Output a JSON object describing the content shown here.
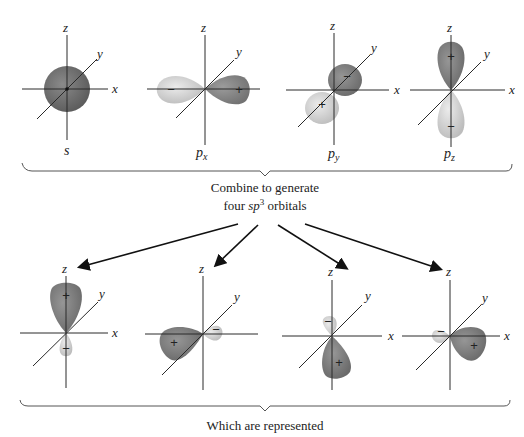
{
  "colors": {
    "dark_lobe": "#6e6e6e",
    "light_lobe": "#d4d4d4",
    "axis": "#2a2a2a",
    "background": "#ffffff"
  },
  "axis_labels": {
    "x": "x",
    "y": "y",
    "z": "z"
  },
  "atomic_orbitals": [
    {
      "id": "s",
      "label": "s",
      "subscript": "",
      "signs": []
    },
    {
      "id": "px",
      "label": "p",
      "subscript": "x",
      "signs": [
        "−",
        "+"
      ]
    },
    {
      "id": "py",
      "label": "p",
      "subscript": "y",
      "signs": [
        "−",
        "+"
      ]
    },
    {
      "id": "pz",
      "label": "p",
      "subscript": "z",
      "signs": [
        "+",
        "−"
      ]
    }
  ],
  "combine_caption": {
    "line1": "Combine to generate",
    "line2_prefix": "four ",
    "line2_italic": "sp",
    "line2_sup": "3",
    "line2_suffix": " orbitals"
  },
  "hybrid_orbitals": [
    {
      "id": "sp3-1",
      "major_sign": "+",
      "minor_sign": "−",
      "direction": "up"
    },
    {
      "id": "sp3-2",
      "major_sign": "+",
      "minor_sign": "−",
      "direction": "front-left"
    },
    {
      "id": "sp3-3",
      "major_sign": "+",
      "minor_sign": "−",
      "direction": "down"
    },
    {
      "id": "sp3-4",
      "major_sign": "+",
      "minor_sign": "−",
      "direction": "right"
    }
  ],
  "bottom_caption": "Which are represented"
}
